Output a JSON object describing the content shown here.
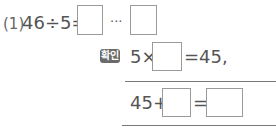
{
  "problem": {
    "number": "(1)",
    "expression": "46÷5=",
    "ellipsis": "···"
  },
  "check": {
    "badge": "확인",
    "line1_prefix": "5×",
    "line1_suffix": "=45,",
    "line2_prefix": "45+",
    "line2_equals": "="
  },
  "colors": {
    "text": "#555555",
    "box_border": "#9a9a9a",
    "badge_bg": "#6a6a6a"
  }
}
